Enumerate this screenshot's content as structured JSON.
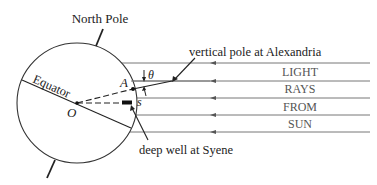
{
  "diagram": {
    "labels": {
      "north_pole": "North Pole",
      "equator": "Equator",
      "center": "O",
      "alexandria_point": "A",
      "syene_point": "s",
      "angle": "θ",
      "vertical_pole": "vertical pole at Alexandria",
      "deep_well": "deep well at Syene"
    },
    "rays_text": [
      "LIGHT",
      "RAYS",
      "FROM",
      "SUN"
    ],
    "colors": {
      "stroke": "#222222",
      "ray_line": "#666666",
      "ray_text": "#555555",
      "background": "#ffffff"
    }
  }
}
